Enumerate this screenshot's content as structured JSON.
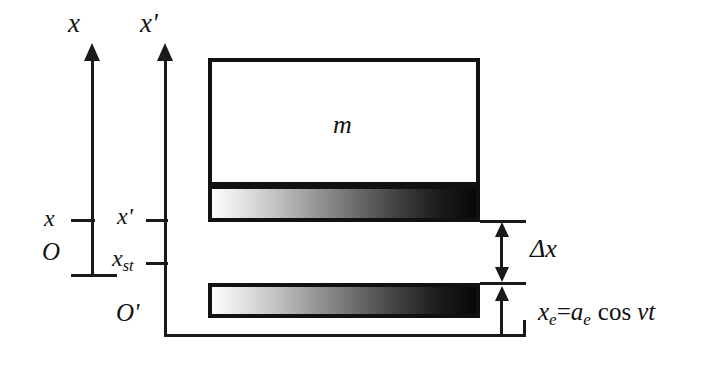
{
  "figure": {
    "kind": "physics-diagram"
  },
  "axes": {
    "inertial": {
      "name": "x-axis",
      "label": "x",
      "origin_label": "O",
      "tick_label": "x"
    },
    "moving": {
      "name": "x-prime-axis",
      "label": "x'",
      "origin_label": "O'",
      "tick_label": "x'",
      "static_label": "x",
      "static_sub": "st"
    }
  },
  "bodies": {
    "mass": {
      "label": "m"
    },
    "spring_layer": {
      "label": ""
    },
    "base": {
      "label": ""
    }
  },
  "dimensions": {
    "gap": {
      "label": "Δx"
    },
    "excitation": {
      "lhs": "x",
      "lhs_sub": "e",
      "eq": "=",
      "amp": "a",
      "amp_sub": "e",
      "fn": "cos",
      "arg": "νt",
      "full": "xₑ=aₑ cos νt"
    }
  },
  "colors": {
    "ink": "#1a1a1a",
    "paper": "#ffffff",
    "gradient_light": "#fdfdfd",
    "gradient_dark": "#070707"
  }
}
